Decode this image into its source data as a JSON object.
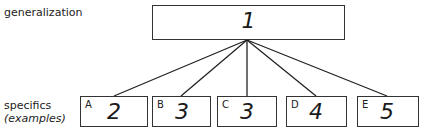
{
  "labels": {
    "top": "generalization",
    "bottom_line1": "specifics",
    "bottom_line2": "(examples)"
  },
  "root": {
    "value": "1"
  },
  "leaves": [
    {
      "letter": "A",
      "value": "2"
    },
    {
      "letter": "B",
      "value": "3"
    },
    {
      "letter": "C",
      "value": "3"
    },
    {
      "letter": "D",
      "value": "4"
    },
    {
      "letter": "E",
      "value": "5"
    }
  ]
}
